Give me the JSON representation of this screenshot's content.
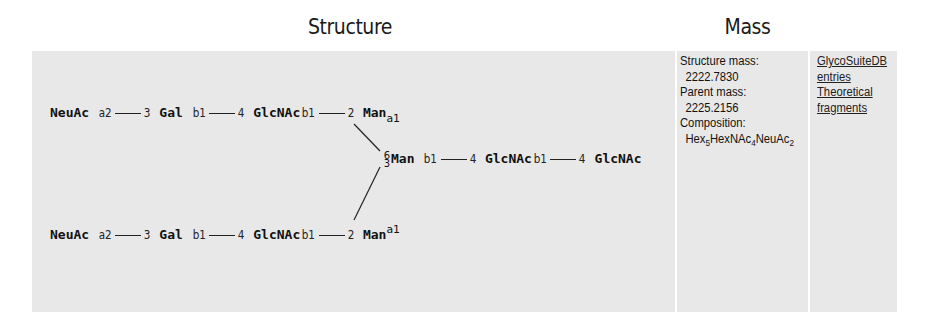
{
  "headers": {
    "structure": "Structure",
    "mass": "Mass"
  },
  "structure": {
    "branch_top": {
      "residues": [
        "NeuAc",
        "Gal",
        "GlcNAc",
        "Man"
      ],
      "linkages": [
        {
          "anomer": "a2",
          "position": "3"
        },
        {
          "anomer": "b1",
          "position": "4"
        },
        {
          "anomer": "b1",
          "position": "2"
        }
      ],
      "terminal_anomer": "a1"
    },
    "branch_bottom": {
      "residues": [
        "NeuAc",
        "Gal",
        "GlcNAc",
        "Man"
      ],
      "linkages": [
        {
          "anomer": "a2",
          "position": "3"
        },
        {
          "anomer": "b1",
          "position": "4"
        },
        {
          "anomer": "b1",
          "position": "2"
        }
      ],
      "terminal_anomer": "a1"
    },
    "core": {
      "branch_positions": [
        "6",
        "3"
      ],
      "residues": [
        "Man",
        "GlcNAc",
        "GlcNAc"
      ],
      "linkages": [
        {
          "anomer": "b1",
          "position": "4"
        },
        {
          "anomer": "b1",
          "position": "4"
        }
      ]
    }
  },
  "mass": {
    "structure_mass_label": "Structure mass:",
    "structure_mass_value": "2222.7830",
    "parent_mass_label": "Parent mass:",
    "parent_mass_value": "2225.2156",
    "composition_label": "Composition:",
    "composition": [
      {
        "name": "Hex",
        "count": "5"
      },
      {
        "name": "HexNAc",
        "count": "4"
      },
      {
        "name": "NeuAc",
        "count": "2"
      }
    ]
  },
  "links": {
    "glycosuite_line1": "GlycoSuiteDB",
    "glycosuite_line2": "entries",
    "fragments_line1": "Theoretical",
    "fragments_line2": "fragments"
  }
}
